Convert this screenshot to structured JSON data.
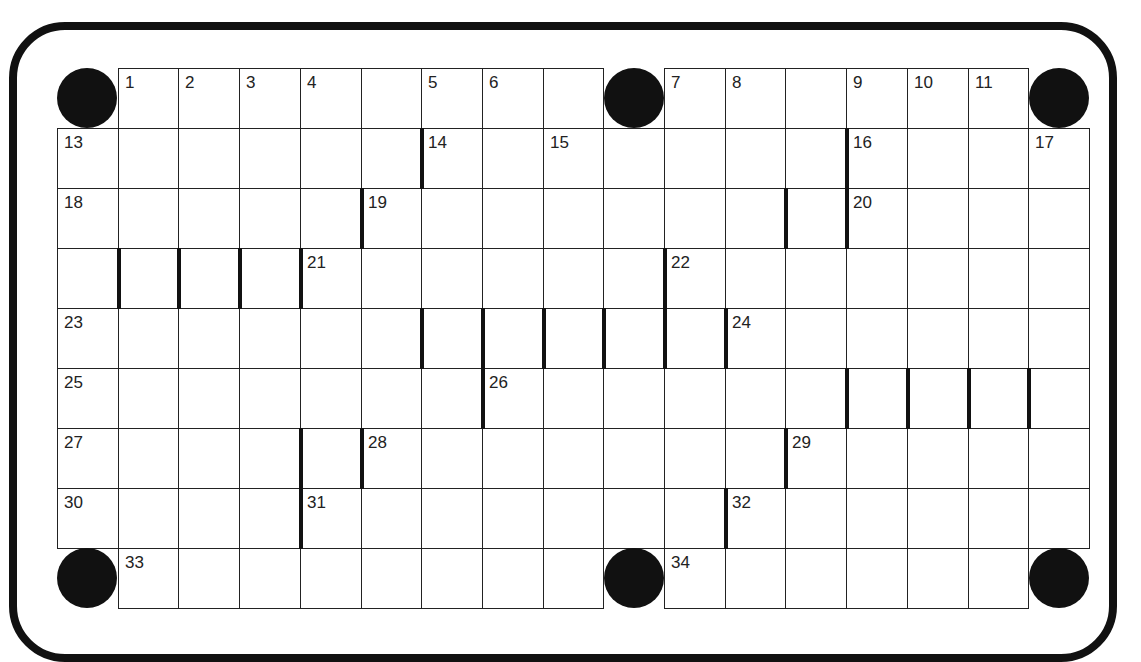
{
  "puzzle": {
    "type": "crossword",
    "cols": 17,
    "rows": 9,
    "colors": {
      "line": "#222222",
      "bar": "#111111",
      "background": "#ffffff"
    },
    "circles": [
      [
        0,
        0
      ],
      [
        0,
        9
      ],
      [
        0,
        16
      ],
      [
        8,
        0
      ],
      [
        8,
        9
      ],
      [
        8,
        16
      ]
    ],
    "numbers": [
      {
        "r": 0,
        "c": 1,
        "n": "1"
      },
      {
        "r": 0,
        "c": 2,
        "n": "2"
      },
      {
        "r": 0,
        "c": 3,
        "n": "3"
      },
      {
        "r": 0,
        "c": 4,
        "n": "4"
      },
      {
        "r": 0,
        "c": 6,
        "n": "5"
      },
      {
        "r": 0,
        "c": 7,
        "n": "6"
      },
      {
        "r": 0,
        "c": 10,
        "n": "7"
      },
      {
        "r": 0,
        "c": 11,
        "n": "8"
      },
      {
        "r": 0,
        "c": 13,
        "n": "9"
      },
      {
        "r": 0,
        "c": 14,
        "n": "10"
      },
      {
        "r": 0,
        "c": 15,
        "n": "11"
      },
      {
        "r": 0,
        "c": 16,
        "n": "12"
      },
      {
        "r": 1,
        "c": 0,
        "n": "13"
      },
      {
        "r": 1,
        "c": 6,
        "n": "14"
      },
      {
        "r": 1,
        "c": 8,
        "n": "15"
      },
      {
        "r": 1,
        "c": 13,
        "n": "16"
      },
      {
        "r": 1,
        "c": 16,
        "n": "17"
      },
      {
        "r": 2,
        "c": 0,
        "n": "18"
      },
      {
        "r": 2,
        "c": 5,
        "n": "19"
      },
      {
        "r": 2,
        "c": 13,
        "n": "20"
      },
      {
        "r": 3,
        "c": 4,
        "n": "21"
      },
      {
        "r": 3,
        "c": 10,
        "n": "22"
      },
      {
        "r": 4,
        "c": 0,
        "n": "23"
      },
      {
        "r": 4,
        "c": 11,
        "n": "24"
      },
      {
        "r": 5,
        "c": 0,
        "n": "25"
      },
      {
        "r": 5,
        "c": 7,
        "n": "26"
      },
      {
        "r": 6,
        "c": 0,
        "n": "27"
      },
      {
        "r": 6,
        "c": 5,
        "n": "28"
      },
      {
        "r": 6,
        "c": 12,
        "n": "29"
      },
      {
        "r": 7,
        "c": 0,
        "n": "30"
      },
      {
        "r": 7,
        "c": 4,
        "n": "31"
      },
      {
        "r": 7,
        "c": 11,
        "n": "32"
      },
      {
        "r": 8,
        "c": 1,
        "n": "33"
      },
      {
        "r": 8,
        "c": 10,
        "n": "34"
      }
    ],
    "bars_left": [
      [
        1,
        6
      ],
      [
        1,
        13
      ],
      [
        2,
        5
      ],
      [
        2,
        12
      ],
      [
        2,
        13
      ],
      [
        3,
        1
      ],
      [
        3,
        2
      ],
      [
        3,
        3
      ],
      [
        3,
        4
      ],
      [
        3,
        10
      ],
      [
        4,
        6
      ],
      [
        4,
        7
      ],
      [
        4,
        8
      ],
      [
        4,
        9
      ],
      [
        4,
        10
      ],
      [
        4,
        11
      ],
      [
        5,
        7
      ],
      [
        5,
        13
      ],
      [
        5,
        14
      ],
      [
        5,
        15
      ],
      [
        5,
        16
      ],
      [
        6,
        4
      ],
      [
        6,
        5
      ],
      [
        6,
        12
      ],
      [
        7,
        4
      ],
      [
        7,
        11
      ]
    ]
  }
}
